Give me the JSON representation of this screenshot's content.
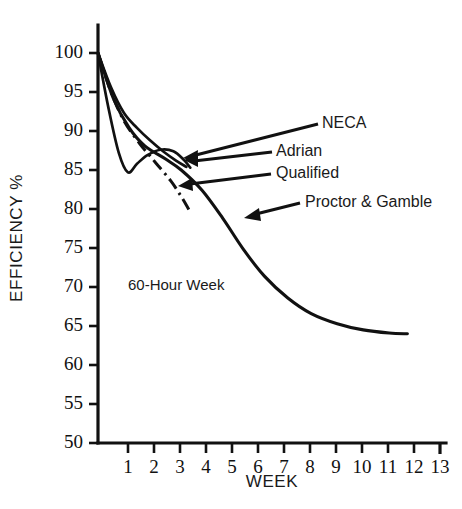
{
  "chart_data": {
    "type": "line",
    "title": "",
    "xlabel": "WEEK",
    "ylabel": "EFFICIENCY %",
    "xlim": [
      0,
      13
    ],
    "ylim": [
      50,
      100
    ],
    "grid": false,
    "legend_position": "inline-callouts",
    "x_ticks": [
      "1",
      "2",
      "3",
      "4",
      "5",
      "6",
      "7",
      "8",
      "9",
      "10",
      "11",
      "12",
      "13"
    ],
    "y_ticks": [
      "50",
      "55",
      "60",
      "65",
      "70",
      "75",
      "80",
      "85",
      "90",
      "95",
      "100"
    ],
    "annotations": [
      {
        "text": "60-Hour Week",
        "x": 1.5,
        "y": 70.5
      }
    ],
    "series": [
      {
        "name": "NECA",
        "style": "solid",
        "points": [
          {
            "x": 0.0,
            "y": 100.0
          },
          {
            "x": 0.5,
            "y": 95.6
          },
          {
            "x": 1.0,
            "y": 92.3
          },
          {
            "x": 1.5,
            "y": 90.4
          },
          {
            "x": 2.0,
            "y": 88.8
          },
          {
            "x": 2.5,
            "y": 87.4
          },
          {
            "x": 3.0,
            "y": 86.2
          },
          {
            "x": 3.4,
            "y": 85.4
          }
        ]
      },
      {
        "name": "Adrian",
        "style": "solid",
        "points": [
          {
            "x": 0.0,
            "y": 100.0
          },
          {
            "x": 0.4,
            "y": 93.0
          },
          {
            "x": 0.8,
            "y": 87.2
          },
          {
            "x": 1.15,
            "y": 84.7
          },
          {
            "x": 1.5,
            "y": 85.8
          },
          {
            "x": 1.9,
            "y": 86.9
          },
          {
            "x": 2.4,
            "y": 87.6
          },
          {
            "x": 2.9,
            "y": 87.4
          },
          {
            "x": 3.3,
            "y": 86.3
          },
          {
            "x": 3.55,
            "y": 85.3
          }
        ]
      },
      {
        "name": "Qualified",
        "style": "dash-dot",
        "points": [
          {
            "x": 0.0,
            "y": 100.0
          },
          {
            "x": 0.5,
            "y": 95.0
          },
          {
            "x": 1.0,
            "y": 91.3
          },
          {
            "x": 1.6,
            "y": 88.4
          },
          {
            "x": 2.2,
            "y": 86.0
          },
          {
            "x": 2.8,
            "y": 83.6
          },
          {
            "x": 3.2,
            "y": 81.6
          },
          {
            "x": 3.5,
            "y": 79.9
          }
        ]
      },
      {
        "name": "Proctor & Gamble",
        "style": "solid",
        "points": [
          {
            "x": 0.0,
            "y": 100.0
          },
          {
            "x": 0.6,
            "y": 94.1
          },
          {
            "x": 1.2,
            "y": 90.4
          },
          {
            "x": 1.8,
            "y": 88.1
          },
          {
            "x": 2.6,
            "y": 86.4
          },
          {
            "x": 3.2,
            "y": 85.0
          },
          {
            "x": 4.0,
            "y": 82.4
          },
          {
            "x": 4.8,
            "y": 78.8
          },
          {
            "x": 5.6,
            "y": 74.8
          },
          {
            "x": 6.4,
            "y": 71.4
          },
          {
            "x": 7.3,
            "y": 68.6
          },
          {
            "x": 8.2,
            "y": 66.6
          },
          {
            "x": 9.2,
            "y": 65.3
          },
          {
            "x": 10.2,
            "y": 64.5
          },
          {
            "x": 11.2,
            "y": 64.1
          },
          {
            "x": 11.9,
            "y": 64.0
          }
        ]
      }
    ]
  },
  "callouts": {
    "neca": {
      "label": "NECA"
    },
    "adrian": {
      "label": "Adrian"
    },
    "qualified": {
      "label": "Qualified"
    },
    "proctor_gamble": {
      "label": "Proctor & Gamble"
    }
  },
  "axes": {
    "x_title": "WEEK",
    "y_title": "EFFICIENCY %"
  },
  "note": {
    "text": "60-Hour Week"
  }
}
